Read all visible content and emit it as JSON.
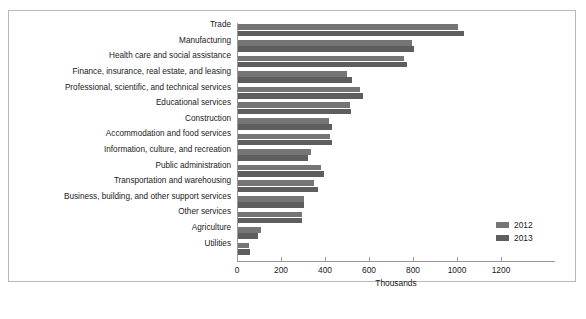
{
  "chart_data": {
    "type": "bar",
    "orientation": "horizontal",
    "title": "",
    "xlabel": "Thousands",
    "ylabel": "",
    "xlim": [
      0,
      1200
    ],
    "xticks": [
      0,
      200,
      400,
      600,
      800,
      1000,
      1200
    ],
    "xticklabels": [
      "0",
      "200",
      "400",
      "600",
      "800",
      "1000",
      "1200"
    ],
    "grid": false,
    "legend_position": "right-middle",
    "categories": [
      "Trade",
      "Manufacturing",
      "Health care and social assistance",
      "Finance, insurance, real estate, and leasing",
      "Professional, scientific, and technical services",
      "Educational services",
      "Construction",
      "Accommodation and food services",
      "Information, culture, and recreation",
      "Public administration",
      "Transportation and warehousing",
      "Business, building, and other support services",
      "Other services",
      "Agriculture",
      "Utilities"
    ],
    "series": [
      {
        "name": "2012",
        "color": "#757575",
        "values": [
          1000,
          790,
          755,
          495,
          555,
          510,
          415,
          420,
          330,
          375,
          345,
          300,
          290,
          105,
          50
        ]
      },
      {
        "name": "2013",
        "color": "#5e5e5e",
        "values": [
          1025,
          800,
          770,
          520,
          570,
          515,
          425,
          425,
          320,
          390,
          365,
          300,
          290,
          90,
          55
        ]
      }
    ]
  },
  "legend": {
    "items": [
      {
        "label": "2012"
      },
      {
        "label": "2013"
      }
    ]
  }
}
